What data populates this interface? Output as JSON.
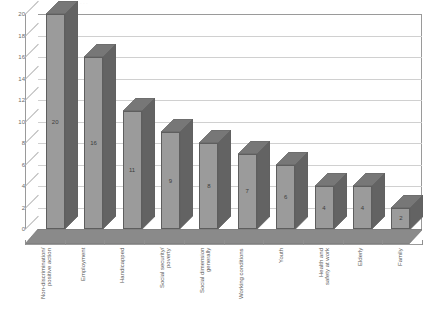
{
  "chart_data": {
    "type": "bar",
    "title": "",
    "xlabel": "",
    "ylabel": "",
    "ylim": [
      0,
      20
    ],
    "ytick_step": 2,
    "grid": true,
    "legend": "none",
    "style": "3d-column",
    "categories": [
      "Non-discrimination/\npositive action",
      "Employment",
      "Handicapped",
      "Social security/\npoverty",
      "Social dimension\ngenerally",
      "Working conditions",
      "Youth",
      "Health and\nsafety at work",
      "Elderly",
      "Family"
    ],
    "values": [
      20,
      16,
      11,
      9,
      8,
      7,
      6,
      4,
      4,
      2
    ],
    "data_labels": [
      "20",
      "16",
      "11",
      "9",
      "8",
      "7",
      "6",
      "4",
      "4",
      "2"
    ],
    "ytick_labels": [
      "0",
      "2",
      "4",
      "6",
      "8",
      "10",
      "12",
      "14",
      "16",
      "18",
      "20"
    ],
    "colors": {
      "bar_front": "#9b9b9b",
      "bar_side": "#636363",
      "bar_top": "#777777",
      "bar_outline": "#5e5e5e",
      "gridline": "#d0d0d0",
      "axis": "#9a9a9a",
      "floor_top": "#8a8a8a",
      "floor_front": "#6f6f6f",
      "text": "#5a5a5a",
      "background": "#ffffff"
    }
  },
  "title_remnant": "· · ·"
}
